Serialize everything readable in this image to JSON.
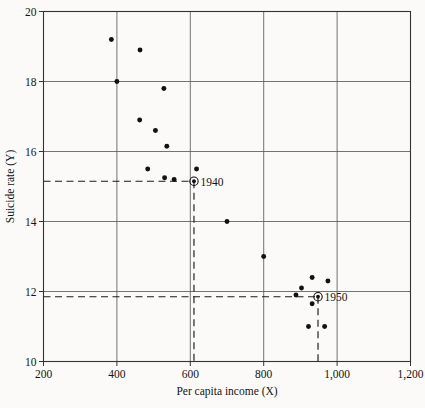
{
  "chart_data": {
    "type": "scatter",
    "title": "",
    "xlabel": "Per capita income (X)",
    "ylabel": "Suicide rate (Y)",
    "xlim": [
      200,
      1200
    ],
    "ylim": [
      10,
      20
    ],
    "xticks": [
      200,
      400,
      600,
      800,
      1000,
      1200
    ],
    "xtick_labels": [
      "200",
      "400",
      "600",
      "800",
      "1,000",
      "1,200"
    ],
    "yticks": [
      10,
      12,
      14,
      16,
      18,
      20
    ],
    "ytick_labels": [
      "10",
      "12",
      "14",
      "16",
      "18",
      "20"
    ],
    "grid": true,
    "legend": "none",
    "points": [
      {
        "x": 385,
        "y": 19.2
      },
      {
        "x": 463,
        "y": 18.9
      },
      {
        "x": 400,
        "y": 18.0
      },
      {
        "x": 528,
        "y": 17.8
      },
      {
        "x": 462,
        "y": 16.9
      },
      {
        "x": 505,
        "y": 16.6
      },
      {
        "x": 536,
        "y": 16.15
      },
      {
        "x": 484,
        "y": 15.5
      },
      {
        "x": 617,
        "y": 15.5
      },
      {
        "x": 530,
        "y": 15.25
      },
      {
        "x": 556,
        "y": 15.2
      },
      {
        "x": 700,
        "y": 14.0
      },
      {
        "x": 800,
        "y": 13.0
      },
      {
        "x": 932,
        "y": 12.4
      },
      {
        "x": 975,
        "y": 12.3
      },
      {
        "x": 903,
        "y": 12.1
      },
      {
        "x": 888,
        "y": 11.9
      },
      {
        "x": 932,
        "y": 11.65
      },
      {
        "x": 922,
        "y": 11.0
      },
      {
        "x": 966,
        "y": 11.0
      }
    ],
    "annotations": [
      {
        "label": "1940",
        "x": 610,
        "y": 15.15,
        "marker": "circled-dot",
        "guides": {
          "horizontal_from_x": 200,
          "vertical_to_y": 10
        }
      },
      {
        "label": "1950",
        "x": 948,
        "y": 11.85,
        "marker": "circled-dot",
        "guides": {
          "horizontal_from_x": 200,
          "vertical_to_y": 10
        }
      }
    ]
  },
  "colors": {
    "point": "#111111",
    "grid": "#5a5a5a",
    "axis": "#333333",
    "background": "#fbfaf8"
  }
}
